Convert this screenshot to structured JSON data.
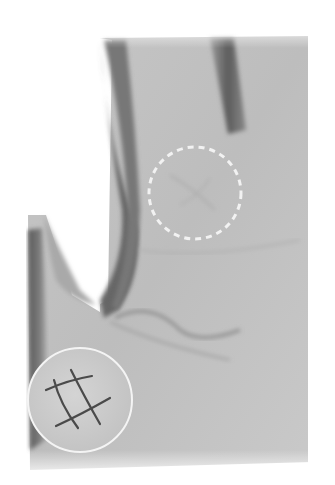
{
  "figure": {
    "colors": {
      "background": "#ffffff",
      "skin_light": "#c9c9c9",
      "skin_mid": "#b4b4b4",
      "shadow": "#5e5e5e",
      "highlight_dash": "#f2f2f2",
      "inset_fill": "#cfcfcf",
      "inset_border": "#f4f4f4",
      "inset_lines": "#4a4a4a"
    },
    "highlight_circle": {
      "style": "dashed",
      "cx": 195,
      "cy": 193,
      "r": 46
    },
    "inset": {
      "symbol": "grid-sign",
      "cx": 80,
      "cy": 400,
      "r": 52
    }
  }
}
